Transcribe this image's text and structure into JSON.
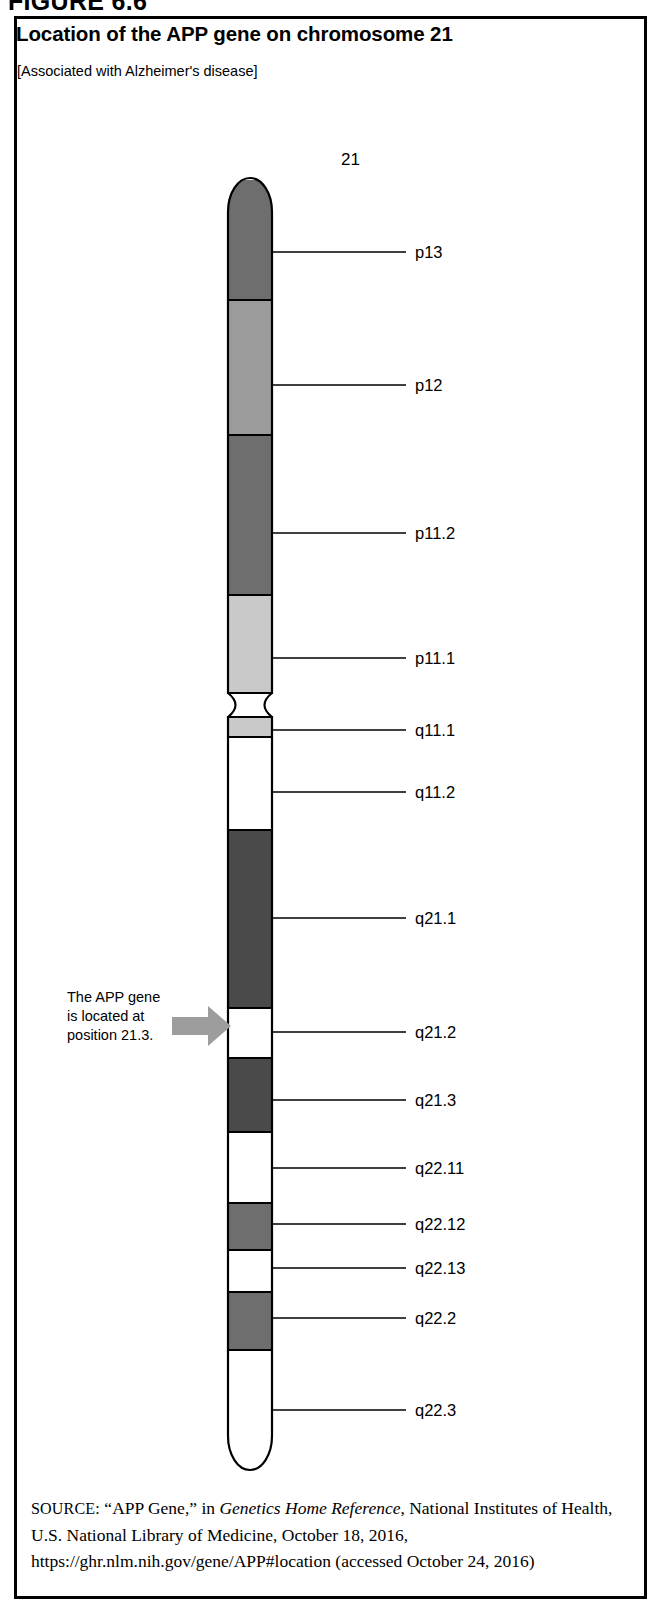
{
  "figure": {
    "number": "FIGURE 6.6",
    "title": "Location of the APP gene on chromosome 21",
    "subtitle": "[Associated with Alzheimer's disease]"
  },
  "chromosome": {
    "number_label": "21",
    "name": "chromosome-21-ideogram"
  },
  "annotation": {
    "line1": "The APP gene",
    "line2": "is located at",
    "line3": "position 21.3.",
    "arrow_name": "gene-pointer-arrow",
    "arrow_color": "#9d9d9d"
  },
  "source": {
    "prefix": "SOURCE:",
    "text_part1": "“APP Gene,” in ",
    "italic_title": "Genetics Home Reference",
    "text_part2": ", National Institutes of Health, U.S. National Library of Medicine, October 18, 2016, https://ghr.nlm.nih.gov/gene/APP#location (accessed October 24, 2016)"
  },
  "chart_data": {
    "type": "ideogram",
    "title": "Location of the APP gene on chromosome 21",
    "chromosome": "21",
    "centromere_y": 705,
    "colors": {
      "dark": "#6e6e6e",
      "medium": "#9b9b9b",
      "light": "#c9c9c9",
      "white": "#ffffff",
      "very_dark": "#4a4a4a",
      "outline": "#000000"
    },
    "bands": [
      {
        "label": "p13",
        "arm": "p",
        "shade": "dark",
        "y_top": 180,
        "y_bottom": 300,
        "leader_y": 252
      },
      {
        "label": "p12",
        "arm": "p",
        "shade": "medium",
        "y_top": 300,
        "y_bottom": 435,
        "leader_y": 385
      },
      {
        "label": "p11.2",
        "arm": "p",
        "shade": "dark",
        "y_top": 435,
        "y_bottom": 595,
        "leader_y": 533
      },
      {
        "label": "p11.1",
        "arm": "p",
        "shade": "light",
        "y_top": 595,
        "y_bottom": 693,
        "leader_y": 658
      },
      {
        "label": "q11.1",
        "arm": "q",
        "shade": "light",
        "y_top": 717,
        "y_bottom": 737,
        "leader_y": 730
      },
      {
        "label": "q11.2",
        "arm": "q",
        "shade": "white",
        "y_top": 737,
        "y_bottom": 830,
        "leader_y": 792
      },
      {
        "label": "q21.1",
        "arm": "q",
        "shade": "very_dark",
        "y_top": 830,
        "y_bottom": 1008,
        "leader_y": 918
      },
      {
        "label": "q21.2",
        "arm": "q",
        "shade": "white",
        "y_top": 1008,
        "y_bottom": 1058,
        "leader_y": 1032
      },
      {
        "label": "q21.3",
        "arm": "q",
        "shade": "very_dark",
        "y_top": 1058,
        "y_bottom": 1132,
        "leader_y": 1100
      },
      {
        "label": "q22.11",
        "arm": "q",
        "shade": "white",
        "y_top": 1132,
        "y_bottom": 1203,
        "leader_y": 1168
      },
      {
        "label": "q22.12",
        "arm": "q",
        "shade": "dark",
        "y_top": 1203,
        "y_bottom": 1250,
        "leader_y": 1224
      },
      {
        "label": "q22.13",
        "arm": "q",
        "shade": "white",
        "y_top": 1250,
        "y_bottom": 1292,
        "leader_y": 1268
      },
      {
        "label": "q22.2",
        "arm": "q",
        "shade": "dark",
        "y_top": 1292,
        "y_bottom": 1350,
        "leader_y": 1318
      },
      {
        "label": "q22.3",
        "arm": "q",
        "shade": "white",
        "y_top": 1350,
        "y_bottom": 1470,
        "leader_y": 1410
      }
    ]
  }
}
